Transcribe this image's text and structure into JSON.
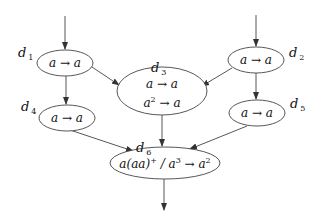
{
  "diagram": {
    "type": "flow-graph",
    "nodes": [
      {
        "id": "d1",
        "label_name": "d",
        "label_index": "1",
        "rules": [
          "a → a"
        ]
      },
      {
        "id": "d2",
        "label_name": "d",
        "label_index": "2",
        "rules": [
          "a → a"
        ]
      },
      {
        "id": "d3",
        "label_name": "d",
        "label_index": "3",
        "rules": [
          "a → a",
          "a2 → a"
        ]
      },
      {
        "id": "d4",
        "label_name": "d",
        "label_index": "4",
        "rules": [
          "a → a"
        ]
      },
      {
        "id": "d5",
        "label_name": "d",
        "label_index": "5",
        "rules": [
          "a → a"
        ]
      },
      {
        "id": "d6",
        "label_name": "d",
        "label_index": "6",
        "rules": [
          "a(aa)+ / a3 → a2"
        ]
      }
    ],
    "edges": [
      {
        "from": "input",
        "to": "d1"
      },
      {
        "from": "input",
        "to": "d2"
      },
      {
        "from": "d1",
        "to": "d3"
      },
      {
        "from": "d2",
        "to": "d3"
      },
      {
        "from": "d1",
        "to": "d4"
      },
      {
        "from": "d2",
        "to": "d5"
      },
      {
        "from": "d3",
        "to": "d6"
      },
      {
        "from": "d4",
        "to": "d6"
      },
      {
        "from": "d5",
        "to": "d6"
      },
      {
        "from": "d6",
        "to": "output"
      }
    ],
    "text": {
      "d": "d",
      "i1": "1",
      "i2": "2",
      "i3": "3",
      "i4": "4",
      "i5": "5",
      "i6": "6",
      "a": "a",
      "arrow": "→",
      "sq": "2",
      "cube": "3",
      "plus": "+",
      "d6_prefix": "a(aa)",
      "d6_mid": " / a",
      "d6_tail": " → a"
    }
  }
}
